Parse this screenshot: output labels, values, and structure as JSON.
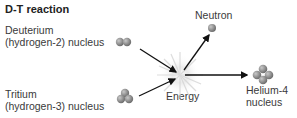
{
  "title": "D-T reaction",
  "labels": {
    "deuterium": [
      "Deuterium",
      "(hydrogen-2) nucleus"
    ],
    "tritium": [
      "Tritium",
      "(hydrogen-3) nucleus"
    ],
    "neutron": "Neutron",
    "energy": "Energy",
    "helium": [
      "Helium-4",
      "nucleus"
    ]
  },
  "colors": {
    "particle": "#8a8a8a",
    "arrow": "#111111",
    "text": "#3a3a3a"
  }
}
